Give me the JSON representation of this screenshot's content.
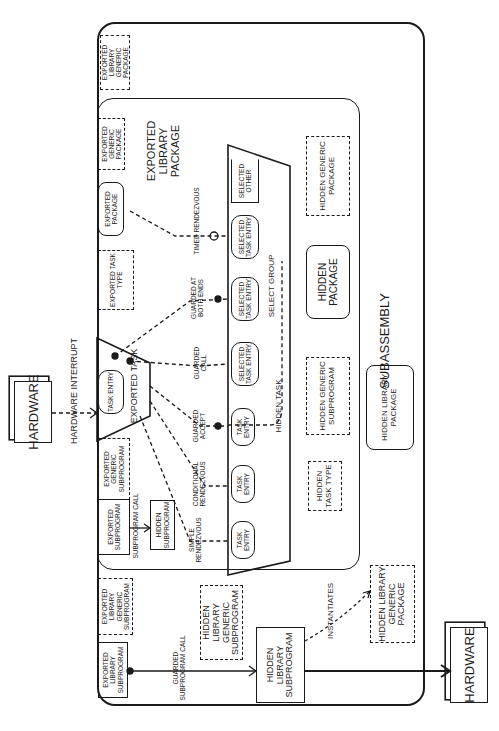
{
  "diagram": {
    "subassembly": {
      "label": "SUBASSEMBLY"
    },
    "exported_library_package": {
      "label": "EXPORTED LIBRARY PACKAGE"
    },
    "hardware_top": {
      "label": "HARDWARE"
    },
    "hardware_bottom": {
      "label": "HARDWARE"
    },
    "hardware_interrupt": {
      "label": "HARDWARE INTERRUPT"
    },
    "exported_library_generic_package": {
      "label": "EXPORTED LIBRARY GENERIC PACKAGE"
    },
    "exported_generic_package": {
      "label": "EXPORTED GENERIC PACKAGE"
    },
    "exported_package": {
      "label": "EXPORTED PACKAGE"
    },
    "exported_task_type": {
      "label": "EXPORTED TASK TYPE"
    },
    "exported_task": {
      "label": "EXPORTED TASK",
      "entry": "TASK ENTRY"
    },
    "exported_generic_subprogram": {
      "label": "EXPORTED GENERIC SUBPROGRAM"
    },
    "exported_subprogram": {
      "label": "EXPORTED SUBPROGRAM"
    },
    "hidden_subprogram": {
      "label": "HIDDEN SUBPROGRAM"
    },
    "subprogram_call": {
      "label": "SUBPROGRAM CALL"
    },
    "exported_library_generic_subprogram": {
      "label": "EXPORTED LIBRARY GENERIC SUBPROGRAM"
    },
    "exported_library_subprogram": {
      "label": "EXPORTED LIBRARY SUBPROGRAM"
    },
    "guarded_subprogram_call": {
      "label": "GUARDED SUBPROGRAM CALL"
    },
    "hidden_library_generic_subprogram": {
      "label": "HIDDEN LIBRARY GENERIC SUBPROGRAM"
    },
    "hidden_library_subprogram": {
      "label": "HIDDEN LIBRARY SUBPROGRAM"
    },
    "instantiates": {
      "label": "INSTANTIATES"
    },
    "hidden_library_generic_package": {
      "label": "HIDDEN LIBRARY GENERIC PACKAGE"
    },
    "hidden_task": {
      "label": "HIDDEN TASK",
      "entries": [
        "TASK ENTRY",
        "TASK ENTRY",
        "TASK ENTRY"
      ],
      "selected_entries": [
        "SELECTED TASK ENTRY",
        "SELECTED TASK ENTRY",
        "SELECTED TASK ENTRY"
      ],
      "selected_other": "SELECTED OTHER",
      "select_group": "SELECT GROUP"
    },
    "rendezvous": {
      "simple": "SIMPLE RENDEZVOUS",
      "conditional": "CONDITIONAL RENDEZVOUS",
      "guarded_accept": "GUARDED ACCEPT",
      "guarded_call": "GUARDED CALL",
      "guarded_both": "GUARDED AT BOTH ENDS",
      "timed": "TIMED RENDEZVOUS"
    },
    "hidden_task_type": {
      "label": "HIDDEN TASK TYPE"
    },
    "hidden_generic_subprogram": {
      "label": "HIDDEN GENERIC SUBPROGRAM"
    },
    "hidden_package": {
      "label": "HIDDEN PACKAGE"
    },
    "hidden_generic_package": {
      "label": "HIDDEN GENERIC PACKAGE"
    },
    "hidden_library_package": {
      "label": "HIDDEN LIBRARY PACKAGE"
    }
  }
}
